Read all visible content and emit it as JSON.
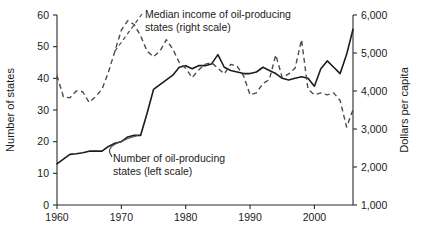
{
  "chart_data": {
    "type": "line",
    "title": "",
    "xlabel": "",
    "ylabel": "Number of states",
    "y2label": "Dollars per capita",
    "xlim": [
      1960,
      2006
    ],
    "ylim": [
      0,
      60
    ],
    "y2lim": [
      1000,
      6000
    ],
    "grid": false,
    "legend_position": "inline-annotations",
    "x_ticks": [
      1960,
      1970,
      1980,
      1990,
      2000
    ],
    "x_tick_labels": [
      "1960",
      "1970",
      "1980",
      "1990",
      "2000"
    ],
    "y_ticks": [
      0,
      10,
      20,
      30,
      40,
      50,
      60
    ],
    "y_tick_labels": [
      "0",
      "10",
      "20",
      "30",
      "40",
      "50",
      "60"
    ],
    "y2_ticks": [
      1000,
      2000,
      3000,
      4000,
      5000,
      6000
    ],
    "y2_tick_labels": [
      "1,000",
      "2,000",
      "3,000",
      "4,000",
      "5,000",
      "6,000"
    ],
    "annotations": [
      {
        "name": "median-income-annotation",
        "line1": "Median income of oil-producing",
        "line2": "states (right scale)",
        "series": "median_income"
      },
      {
        "name": "number-of-states-annotation",
        "line1": "Number of oil-producing",
        "line2": "states (left scale)",
        "series": "number_of_states"
      }
    ],
    "x": [
      1960,
      1961,
      1962,
      1963,
      1964,
      1965,
      1966,
      1967,
      1968,
      1969,
      1970,
      1971,
      1972,
      1973,
      1974,
      1975,
      1976,
      1977,
      1978,
      1979,
      1980,
      1981,
      1982,
      1983,
      1984,
      1985,
      1986,
      1987,
      1988,
      1989,
      1990,
      1991,
      1992,
      1993,
      1994,
      1995,
      1996,
      1997,
      1998,
      1999,
      2000,
      2001,
      2002,
      2003,
      2004,
      2005,
      2006
    ],
    "series": [
      {
        "name": "Number of oil-producing states (left scale)",
        "axis": "left",
        "style": "solid",
        "units": "states",
        "values": [
          13,
          14.5,
          16,
          16.2,
          16.5,
          17,
          17,
          17,
          18.5,
          19.5,
          20,
          21.5,
          22,
          22,
          29,
          36.5,
          38,
          39.5,
          41,
          43.5,
          44,
          43,
          44,
          44,
          44.5,
          47.5,
          43.5,
          42.5,
          42,
          41.5,
          41.5,
          42,
          43.5,
          42.5,
          41.5,
          40,
          39.5,
          40,
          40.5,
          40,
          37.5,
          43,
          45.5,
          43.5,
          41.5,
          47.5,
          55.5
        ]
      },
      {
        "name": "Median income of oil-producing states (right scale)",
        "axis": "right",
        "style": "dashed",
        "units": "dollars per capita",
        "values": [
          4400,
          3850,
          3820,
          4000,
          3980,
          3700,
          3850,
          4050,
          4500,
          5050,
          5600,
          5850,
          5750,
          5450,
          5050,
          4900,
          5050,
          5350,
          5100,
          4750,
          4600,
          4350,
          4550,
          4700,
          4750,
          4600,
          4450,
          4700,
          4650,
          4400,
          3900,
          3950,
          4200,
          4300,
          4950,
          4350,
          4450,
          4600,
          5350,
          4050,
          3900,
          3950,
          3900,
          3950,
          3750,
          3050,
          3500
        ]
      }
    ]
  },
  "caption": {
    "text": ""
  }
}
